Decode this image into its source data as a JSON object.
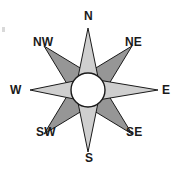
{
  "figure": {
    "background_color": "#ffffff",
    "width": 177,
    "height": 175
  },
  "compass": {
    "center": {
      "x": 88,
      "y": 90
    },
    "hub": {
      "shape": "circle",
      "radius": 17,
      "fill_color": "#ffffff",
      "stroke_color": "#1a1a1a"
    },
    "style": {
      "cardinal_fill": "#cfcfcf",
      "intercardinal_fill": "#969696",
      "outline_color": "#1a1a1a",
      "label_color": "#1a1a1a"
    },
    "points": [
      {
        "id": "n",
        "label": "N",
        "bearing_degrees": 0,
        "kind": "cardinal",
        "fill_color": "#cfcfcf"
      },
      {
        "id": "ne",
        "label": "NE",
        "bearing_degrees": 45,
        "kind": "intercardinal",
        "fill_color": "#969696"
      },
      {
        "id": "e",
        "label": "E",
        "bearing_degrees": 90,
        "kind": "cardinal",
        "fill_color": "#cfcfcf"
      },
      {
        "id": "se",
        "label": "SE",
        "bearing_degrees": 135,
        "kind": "intercardinal",
        "fill_color": "#969696"
      },
      {
        "id": "s",
        "label": "S",
        "bearing_degrees": 180,
        "kind": "cardinal",
        "fill_color": "#cfcfcf"
      },
      {
        "id": "sw",
        "label": "SW",
        "bearing_degrees": 225,
        "kind": "intercardinal",
        "fill_color": "#969696"
      },
      {
        "id": "w",
        "label": "W",
        "bearing_degrees": 270,
        "kind": "cardinal",
        "fill_color": "#cfcfcf"
      },
      {
        "id": "nw",
        "label": "NW",
        "bearing_degrees": 315,
        "kind": "intercardinal",
        "fill_color": "#969696"
      }
    ]
  }
}
